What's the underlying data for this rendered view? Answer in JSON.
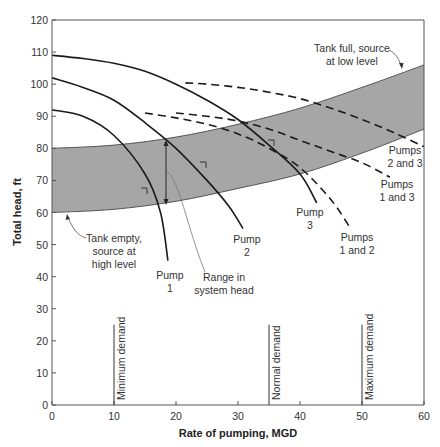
{
  "chart_data": {
    "type": "line",
    "title": "",
    "xlabel": "Rate of pumping, MGD",
    "ylabel": "Total head, ft",
    "xlim": [
      0,
      60
    ],
    "ylim": [
      0,
      120
    ],
    "xticks": [
      0,
      10,
      20,
      30,
      40,
      50,
      60
    ],
    "yticks": [
      0,
      10,
      20,
      30,
      40,
      50,
      60,
      70,
      80,
      90,
      100,
      110,
      120
    ],
    "grid": false,
    "band": {
      "name": "Range in system head",
      "color": "#a6a6a6",
      "lower": {
        "label": "Tank empty, source at high level",
        "x": [
          0,
          10,
          20,
          30,
          40,
          50,
          60
        ],
        "y": [
          60,
          61,
          63.5,
          67.5,
          72,
          78.5,
          86
        ]
      },
      "upper": {
        "label": "Tank full, source at low level",
        "x": [
          0,
          10,
          20,
          30,
          40,
          50,
          60
        ],
        "y": [
          80,
          81,
          83.5,
          87.5,
          92.5,
          99,
          106
        ]
      }
    },
    "series": [
      {
        "name": "Pump 1",
        "style": "solid",
        "x": [
          0,
          5,
          10,
          15,
          17.5,
          18.7
        ],
        "y": [
          92,
          90,
          84,
          72,
          60,
          45
        ]
      },
      {
        "name": "Pump 2",
        "style": "solid",
        "x": [
          0,
          5,
          10,
          15,
          20,
          25,
          28.5,
          30.8
        ],
        "y": [
          102,
          99,
          95,
          88,
          80,
          70,
          62,
          55
        ]
      },
      {
        "name": "Pump 3",
        "style": "solid",
        "x": [
          0,
          5,
          10,
          15,
          20,
          25,
          30,
          35,
          40,
          42.7
        ],
        "y": [
          109,
          108,
          106.5,
          104,
          100,
          95,
          89,
          81,
          72,
          63
        ]
      },
      {
        "name": "Pumps 1 and 2",
        "style": "dashed",
        "x": [
          15,
          20,
          25,
          30,
          35,
          40,
          45,
          48
        ],
        "y": [
          91,
          89.5,
          87.5,
          84.5,
          80,
          74,
          64,
          55.5
        ]
      },
      {
        "name": "Pumps 1 and 3",
        "style": "dashed",
        "x": [
          20,
          25,
          30,
          35,
          40,
          45,
          50,
          54.5
        ],
        "y": [
          91,
          90,
          88.5,
          86,
          82.5,
          79,
          75.5,
          71
        ]
      },
      {
        "name": "Pumps 2 and 3",
        "style": "dashed",
        "x": [
          21.5,
          25,
          30,
          35,
          40,
          45,
          50,
          55,
          60
        ],
        "y": [
          100.4,
          100,
          99,
          97.5,
          95.5,
          92.5,
          89,
          85,
          80.5
        ]
      }
    ],
    "demand_lines": [
      {
        "label": "Minimum demand",
        "x": 10,
        "height": 25
      },
      {
        "label": "Normal demand",
        "x": 35,
        "height": 25
      },
      {
        "label": "Maximum demand",
        "x": 50,
        "height": 25
      }
    ],
    "annotations": [
      "Tank full, source at low level",
      "Tank empty, source at high level",
      "Range in system head",
      "Pump 1",
      "Pump 2",
      "Pump 3",
      "Pumps 1 and 2",
      "Pumps 1 and 3",
      "Pumps 2 and 3"
    ]
  },
  "labels": {
    "xlabel": "Rate of pumping, MGD",
    "ylabel": "Total head, ft",
    "tank_full_1": "Tank full, source",
    "tank_full_2": "at low level",
    "tank_empty_1": "Tank empty,",
    "tank_empty_2": "source at",
    "tank_empty_3": "high level",
    "range_1": "Range in",
    "range_2": "system head",
    "pump1_1": "Pump",
    "pump1_2": "1",
    "pump2_1": "Pump",
    "pump2_2": "2",
    "pump3_1": "Pump",
    "pump3_2": "3",
    "p12_1": "Pumps",
    "p12_2": "1 and 2",
    "p13_1": "Pumps",
    "p13_2": "1 and 3",
    "p23_1": "Pumps",
    "p23_2": "2 and 3",
    "min_demand": "Minimum demand",
    "normal_demand": "Normal demand",
    "max_demand": "Maximum demand"
  }
}
